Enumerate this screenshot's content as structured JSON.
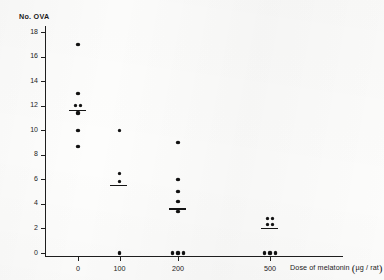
{
  "figure": {
    "y_axis_title": "No. OVA",
    "x_axis_caption_text": "Dose of melatonin",
    "x_axis_caption_units": "µg / rat",
    "paren_open": "(",
    "paren_close": ")"
  },
  "chart_data": {
    "type": "scatter",
    "title": "",
    "subtitle": "",
    "xlabel": "Dose of melatonin ( µg / rat )",
    "ylabel": "No. OVA",
    "grid": false,
    "legend": null,
    "ylim": [
      0,
      18
    ],
    "yticks": [
      0,
      2,
      4,
      6,
      8,
      10,
      12,
      14,
      16,
      18
    ],
    "ytick_labels": [
      "0",
      "2",
      "4",
      "6",
      "8",
      "10",
      "12",
      "14",
      "16",
      "18"
    ],
    "xticks": [
      0,
      100,
      200,
      500
    ],
    "xtick_labels": [
      "0",
      "100",
      "200",
      "500"
    ],
    "x_scale": "categorical",
    "groups": [
      {
        "x_label": "0",
        "dose": 0,
        "values": [
          17.0,
          13.0,
          12.0,
          12.0,
          11.4,
          10.0,
          8.7
        ],
        "mean": 11.6,
        "n": 7
      },
      {
        "x_label": "100",
        "dose": 100,
        "values": [
          10.0,
          6.5,
          5.8,
          0.0
        ],
        "mean": 5.5,
        "n": 4
      },
      {
        "x_label": "200",
        "dose": 200,
        "values": [
          9.0,
          6.0,
          5.0,
          4.2,
          3.4,
          0.0,
          0.0,
          0.0
        ],
        "mean": 3.6,
        "n": 8
      },
      {
        "x_label": "500",
        "dose": 500,
        "values": [
          2.8,
          2.8,
          2.3,
          2.3,
          0.0,
          0.0,
          0.0
        ],
        "mean": 2.0,
        "n": 7
      }
    ]
  }
}
